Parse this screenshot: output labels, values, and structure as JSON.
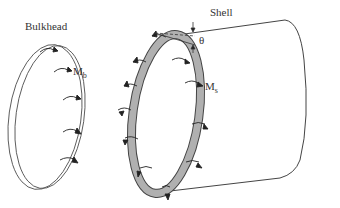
{
  "labels": {
    "bulkhead": "Bulkhead",
    "shell": "Shell",
    "mb_main": "M",
    "mb_sub": "b",
    "ms_main": "M",
    "ms_sub": "s",
    "theta": "θ"
  },
  "colors": {
    "line": "#444444",
    "ring_fill": "#b0b0b0",
    "arrow": "#222222",
    "text": "#333333"
  }
}
